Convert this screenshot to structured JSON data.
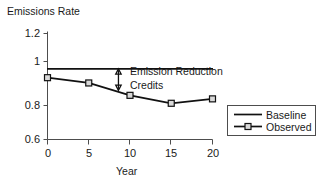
{
  "chart_data": {
    "type": "line",
    "title": "",
    "ylabel": "Emissions Rate",
    "xlabel": "Year",
    "x": [
      0,
      5,
      10,
      15,
      20
    ],
    "xlim": [
      0,
      20
    ],
    "ylim": [
      0.6,
      1.2
    ],
    "grid": false,
    "legend_position": "right-outside",
    "xticks": [
      "0",
      "5",
      "10",
      "15",
      "20"
    ],
    "yticks": [
      "1.2",
      "1",
      "0.8",
      "0.6"
    ],
    "ytick_values": [
      1.2,
      1.0,
      0.8,
      0.6
    ],
    "series": [
      {
        "name": "Baseline",
        "values": [
          1.0,
          1.0,
          1.0,
          1.0,
          1.0
        ],
        "marker": "none",
        "color": "#111111"
      },
      {
        "name": "Observed",
        "values": [
          0.95,
          0.92,
          0.85,
          0.805,
          0.83
        ],
        "marker": "square",
        "color": "#111111"
      }
    ],
    "annotations": [
      {
        "text_lines": [
          "Emission Reduction",
          "Credits"
        ],
        "text": "Emission Reduction Credits",
        "arrow": "double-headed-vertical",
        "arrow_x_year": 8.6,
        "arrow_y_top": 1.0,
        "arrow_y_bottom": 0.878
      }
    ]
  },
  "axes": {
    "y_title": "Emissions Rate",
    "x_title": "Year",
    "y_tick_labels": [
      "1.2",
      "1",
      "0.8",
      "0.6"
    ],
    "x_tick_labels": [
      "0",
      "5",
      "10",
      "15",
      "20"
    ]
  },
  "annotation": {
    "line1": "Emission Reduction",
    "line2": "Credits"
  },
  "legend": {
    "entries": [
      {
        "label": "Baseline"
      },
      {
        "label": "Observed"
      }
    ]
  },
  "colors": {
    "line": "#111111",
    "axis": "#4d4d4d",
    "marker_fill": "#d9d9d9",
    "background": "#ffffff"
  }
}
